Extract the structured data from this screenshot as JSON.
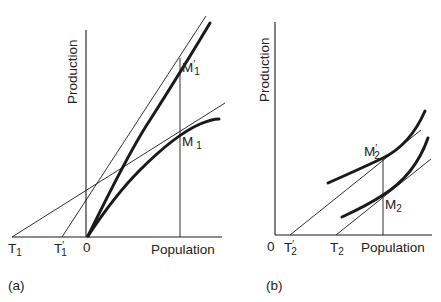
{
  "figure": {
    "panels": [
      {
        "id": "a",
        "caption": "(a)",
        "y_axis_label": "Production",
        "x_axis_label": "Population",
        "origin_label": "0",
        "points": [
          {
            "label": "T",
            "sub": "1",
            "prime": false
          },
          {
            "label": "T",
            "sub": "1",
            "prime": true
          },
          {
            "label": "M",
            "sub": "1",
            "prime": true
          },
          {
            "label": "M",
            "sub": "1",
            "prime": false
          }
        ]
      },
      {
        "id": "b",
        "caption": "(b)",
        "y_axis_label": "Production",
        "x_axis_label": "Population",
        "origin_label": "0",
        "points": [
          {
            "label": "T",
            "sub": "2",
            "prime": true
          },
          {
            "label": "T",
            "sub": "2",
            "prime": false
          },
          {
            "label": "M",
            "sub": "2",
            "prime": true
          },
          {
            "label": "M",
            "sub": "2",
            "prime": false
          }
        ]
      }
    ],
    "prime_mark": "′"
  }
}
